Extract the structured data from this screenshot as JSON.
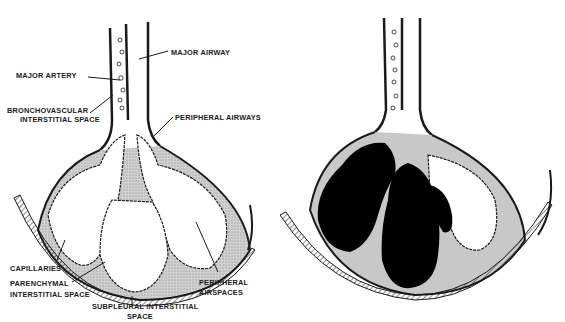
{
  "figure": {
    "left_panel": {
      "description": "Normal lung lobule diagram with labeled interstitial compartments",
      "labels": {
        "major_airway": "MAJOR AIRWAY",
        "major_artery": "MAJOR ARTERY",
        "bronchovascular_1": "BRONCHOVASCULAR",
        "bronchovascular_2": "INTERSTITIAL SPACE",
        "peripheral_airways": "PERIPHERAL AIRWAYS",
        "capillaries": "CAPILLARIES",
        "parenchymal_1": "PARENCHYMAL",
        "parenchymal_2": "INTERSTITIAL SPACE",
        "subpleural_1": "SUBPLEURAL INTERSTITIAL",
        "subpleural_2": "SPACE",
        "peripheral_airspaces_1": "PERIPHERAL",
        "peripheral_airspaces_2": "AIRSPACES"
      }
    },
    "right_panel": {
      "description": "Same lobule with airspaces filled (consolidation shown in black)"
    },
    "colors": {
      "ink": "#1a1a1a",
      "tissue": "#c8c8c8",
      "fill": "#000000",
      "background": "#ffffff"
    }
  }
}
